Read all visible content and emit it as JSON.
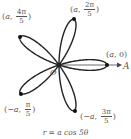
{
  "diagram": {
    "equation": "r = a cos 5θ",
    "curve": {
      "type": "rose",
      "n": 5,
      "amplitude_px": 48,
      "center": [
        59,
        65
      ],
      "stroke": "#222222",
      "stroke_width": 1.4
    },
    "axis": {
      "label": "A",
      "origin_label": "O",
      "color": "#444444"
    },
    "points": [
      {
        "name": "a-0",
        "r": "a",
        "theta": "0",
        "x": 107,
        "y": 65
      },
      {
        "name": "a-2pi5",
        "r": "a",
        "theta_num": "2π",
        "theta_den": "5",
        "x": 74,
        "y": 19
      },
      {
        "name": "a-4pi5",
        "r": "a",
        "theta_num": "4π",
        "theta_den": "5",
        "x": 20,
        "y": 37
      },
      {
        "name": "neg-a-pi5",
        "r": "−a",
        "theta_num": "π",
        "theta_den": "5",
        "x": 21,
        "y": 94
      },
      {
        "name": "neg-a-3pi5",
        "r": "−a",
        "theta_num": "3π",
        "theta_den": "5",
        "x": 75,
        "y": 111
      }
    ],
    "labels": {
      "p0": {
        "open": "(",
        "r": "a",
        "sep": ", ",
        "theta": "0",
        "close": ")"
      },
      "p1": {
        "open": "(",
        "r": "a",
        "sep": ", ",
        "num": "2π",
        "den": "5",
        "close": ")"
      },
      "p2": {
        "open": "(",
        "r": "a",
        "sep": ", ",
        "num": "4π",
        "den": "5",
        "close": ")"
      },
      "p3": {
        "open": "(",
        "r": "−a",
        "sep": ", ",
        "num": "π",
        "den": "5",
        "close": ")"
      },
      "p4": {
        "open": "(",
        "r": "−a",
        "sep": ", ",
        "num": "3π",
        "den": "5",
        "close": ")"
      }
    }
  }
}
